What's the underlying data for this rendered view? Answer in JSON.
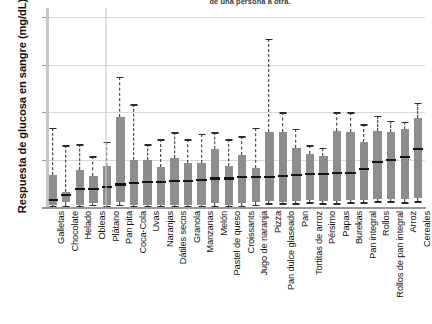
{
  "caption": "de una persona a otra.",
  "chart_data": {
    "type": "boxplot",
    "title": "",
    "xlabel": "",
    "ylabel": "Respuesta de glucosa en sangre (mg/dL)",
    "ylim": [
      0,
      84
    ],
    "yticks": [
      0,
      20,
      40,
      60,
      80
    ],
    "grid": true,
    "legend": "none",
    "units": "mg/dL",
    "categories": [
      "Galletas",
      "Chocolate",
      "Helado",
      "Obleas",
      "Plátano",
      "Pan pita",
      "Coca-Cola",
      "Uvas",
      "Naranjas",
      "Dátiles secos",
      "Granola",
      "Manzanas",
      "Melón",
      "Pastel de queso",
      "Croissants",
      "Jugo de naranja",
      "Pizza",
      "Pan dulce glaseado",
      "Pan",
      "Tortitas de arroz",
      "Pérsimo",
      "Papas",
      "Burekas",
      "Pan integral",
      "Rollos",
      "Rollos de pan integral",
      "Arroz",
      "Cereales"
    ],
    "series": [
      {
        "name": "Galletas",
        "whisker_low": 0.5,
        "q1": 1.0,
        "median": 3.0,
        "q3": 13.5,
        "whisker_high": 33.5
      },
      {
        "name": "Chocolate",
        "whisker_low": 0.5,
        "q1": 2.0,
        "median": 5.0,
        "q3": 6.5,
        "whisker_high": 26.0
      },
      {
        "name": "Helado",
        "whisker_low": 0.5,
        "q1": 1.0,
        "median": 7.5,
        "q3": 15.5,
        "whisker_high": 26.5
      },
      {
        "name": "Obleas",
        "whisker_low": 1.0,
        "q1": 1.5,
        "median": 7.5,
        "q3": 13.0,
        "whisker_high": 21.5
      },
      {
        "name": "Plátano",
        "whisker_low": 0.5,
        "q1": 1.0,
        "median": 8.5,
        "q3": 17.5,
        "whisker_high": 27.5
      },
      {
        "name": "Pan pita",
        "whisker_low": 1.0,
        "q1": 2.0,
        "median": 9.5,
        "q3": 38.0,
        "whisker_high": 55.0
      },
      {
        "name": "Coca-Cola",
        "whisker_low": 0.5,
        "q1": 1.0,
        "median": 10.0,
        "q3": 20.0,
        "whisker_high": 43.5
      },
      {
        "name": "Uvas",
        "whisker_low": 0.5,
        "q1": 1.0,
        "median": 10.5,
        "q3": 20.0,
        "whisker_high": 26.5
      },
      {
        "name": "Naranjas",
        "whisker_low": 0.5,
        "q1": 1.0,
        "median": 10.5,
        "q3": 17.0,
        "whisker_high": 28.5
      },
      {
        "name": "Dátiles secos",
        "whisker_low": 0.5,
        "q1": 1.0,
        "median": 11.0,
        "q3": 20.5,
        "whisker_high": 31.5
      },
      {
        "name": "Granola",
        "whisker_low": 0.5,
        "q1": 1.0,
        "median": 11.0,
        "q3": 18.5,
        "whisker_high": 28.5
      },
      {
        "name": "Manzanas",
        "whisker_low": 0.5,
        "q1": 1.0,
        "median": 11.5,
        "q3": 18.5,
        "whisker_high": 31.0
      },
      {
        "name": "Melón",
        "whisker_low": 0.5,
        "q1": 1.5,
        "median": 12.0,
        "q3": 24.5,
        "whisker_high": 31.5
      },
      {
        "name": "Pastel de queso",
        "whisker_low": 0.5,
        "q1": 1.0,
        "median": 12.0,
        "q3": 17.5,
        "whisker_high": 28.5
      },
      {
        "name": "Croissants",
        "whisker_low": 0.5,
        "q1": 1.5,
        "median": 12.5,
        "q3": 22.0,
        "whisker_high": 30.0
      },
      {
        "name": "Jugo de naranja",
        "whisker_low": 1.0,
        "q1": 2.0,
        "median": 12.5,
        "q3": 16.5,
        "whisker_high": 33.5
      },
      {
        "name": "Pizza",
        "whisker_low": 1.5,
        "q1": 2.5,
        "median": 12.5,
        "q3": 31.5,
        "whisker_high": 71.0
      },
      {
        "name": "Pan dulce glaseado",
        "whisker_low": 1.5,
        "q1": 2.0,
        "median": 13.0,
        "q3": 31.5,
        "whisker_high": 40.0
      },
      {
        "name": "Pan",
        "whisker_low": 1.5,
        "q1": 2.5,
        "median": 13.5,
        "q3": 25.0,
        "whisker_high": 33.0
      },
      {
        "name": "Tortitas de arroz",
        "whisker_low": 2.0,
        "q1": 3.0,
        "median": 14.0,
        "q3": 22.5,
        "whisker_high": 26.0
      },
      {
        "name": "Pérsimo",
        "whisker_low": 1.5,
        "q1": 2.5,
        "median": 14.0,
        "q3": 21.5,
        "whisker_high": 25.0
      },
      {
        "name": "Papas",
        "whisker_low": 1.5,
        "q1": 2.5,
        "median": 14.5,
        "q3": 32.0,
        "whisker_high": 40.0
      },
      {
        "name": "Burekas",
        "whisker_low": 2.0,
        "q1": 3.0,
        "median": 14.5,
        "q3": 31.5,
        "whisker_high": 40.0
      },
      {
        "name": "Pan integral",
        "whisker_low": 2.0,
        "q1": 3.0,
        "median": 16.0,
        "q3": 27.5,
        "whisker_high": 35.0
      },
      {
        "name": "Rollos",
        "whisker_low": 2.5,
        "q1": 3.5,
        "median": 19.0,
        "q3": 32.0,
        "whisker_high": 38.5
      },
      {
        "name": "Rollos de pan integral",
        "whisker_low": 2.5,
        "q1": 3.5,
        "median": 20.0,
        "q3": 31.5,
        "whisker_high": 36.5
      },
      {
        "name": "Arroz",
        "whisker_low": 2.0,
        "q1": 3.5,
        "median": 21.0,
        "q3": 33.0,
        "whisker_high": 36.0
      },
      {
        "name": "Cereales",
        "whisker_low": 2.5,
        "q1": 4.0,
        "median": 24.5,
        "q3": 37.5,
        "whisker_high": 44.0
      }
    ],
    "colors": {
      "box_fill": "#8d8d8d",
      "median": "#141414",
      "whisker": "#2b2b2b",
      "gridline": "#d9d9d9",
      "axis": "#9a9a9a",
      "background": "#ffffff"
    }
  }
}
